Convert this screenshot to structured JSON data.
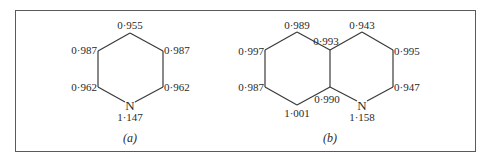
{
  "figure": {
    "panel_a": {
      "caption": "(a)",
      "molecule": "pyridine",
      "heteroatom": "N",
      "values": {
        "top": "0·955",
        "upper_left": "0·987",
        "upper_right": "0·987",
        "lower_left": "0·962",
        "lower_right": "0·962",
        "nitrogen": "1·147"
      }
    },
    "panel_b": {
      "caption": "(b)",
      "molecule": "quinoline",
      "heteroatom": "N",
      "values": {
        "left_top": "0·989",
        "left_upper_left": "0·997",
        "left_lower_left": "0·987",
        "left_bottom": "1·001",
        "fusion_top": "0·993",
        "fusion_bottom": "0·990",
        "right_top": "0·943",
        "right_upper_right": "0·995",
        "right_lower_right": "0·947",
        "nitrogen": "1·158"
      }
    },
    "colors": {
      "line": "#3a3a3a",
      "text": "#2a2a2a",
      "frame": "#5a5a5a"
    }
  }
}
